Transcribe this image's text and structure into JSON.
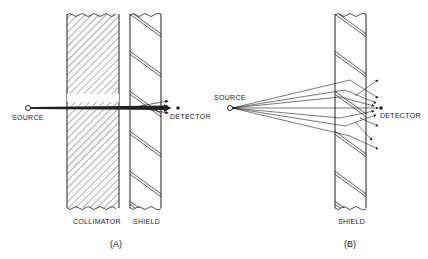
{
  "panel_a": {
    "caption": "(A)",
    "source_label": "SOURCE",
    "detector_label": "DETECTOR",
    "collimator_label": "COLLIMATOR",
    "shield_label": "SHIELD"
  },
  "panel_b": {
    "caption": "(B)",
    "source_label": "SOURCE",
    "detector_label": "DETECTOR",
    "shield_label": "SHIELD"
  }
}
